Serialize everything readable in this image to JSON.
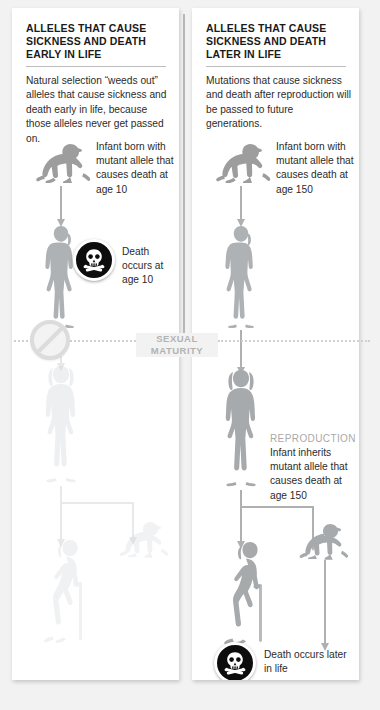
{
  "background_color": "#f2f2f2",
  "panel_color": "#ffffff",
  "accent_gray": "#a9a9a9",
  "figure_gray": "#9a9a9a",
  "ghost_gray": "#ededed",
  "left_panel": {
    "heading": "ALLELES THAT CAUSE SICKNESS AND DEATH EARLY IN LIFE",
    "intro": "Natural selection “weeds out” alleles that cause sickness and death early in life, because those alleles never get passed on.",
    "infant_note": "Infant born with mutant allele that causes death at age 10",
    "death_note": "Death occurs at age 10",
    "blocked_icon": "prohibition-icon",
    "death_icon": "skull-and-crossbones-icon"
  },
  "right_panel": {
    "heading": "ALLELES THAT CAUSE SICKNESS AND DEATH LATER IN LIFE",
    "intro": "Mutations that cause sickness and death after reproduction will be passed to future generations.",
    "infant_note": "Infant born with mutant allele that causes death at age 150",
    "reproduction_label": "REPRODUCTION",
    "reproduction_note": "Infant inherits mutant allele that causes death at age 150",
    "death_note": "Death occurs later in life",
    "death_icon": "skull-and-crossbones-icon"
  },
  "maturity": {
    "line1": "SEXUAL",
    "line2": "MATURITY"
  }
}
